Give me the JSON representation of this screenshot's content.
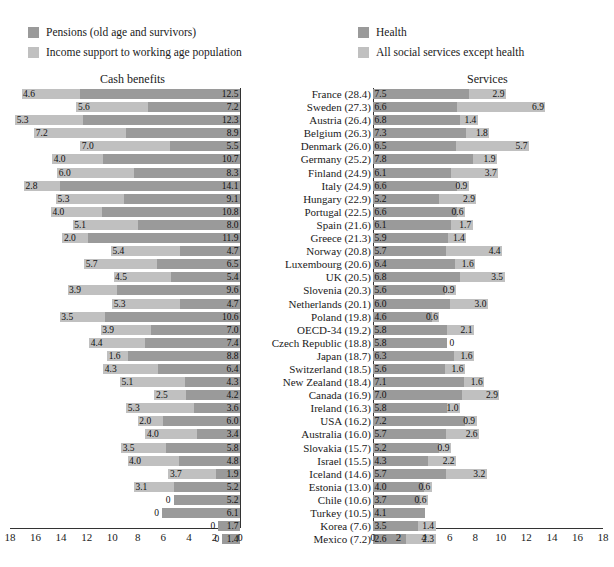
{
  "legends": {
    "left": [
      {
        "swatch": "dark",
        "label": "Pensions (old age and survivors)"
      },
      {
        "swatch": "light",
        "label": "Income support to working age population"
      }
    ],
    "right": [
      {
        "swatch": "dark",
        "label": "Health"
      },
      {
        "swatch": "light",
        "label": "All social services except health"
      }
    ]
  },
  "panels": {
    "left_title": "Cash benefits",
    "right_title": "Services"
  },
  "colors": {
    "dark": "#9a9a9a",
    "light": "#c0c0c0",
    "axis": "#333333",
    "background": "#ffffff"
  },
  "axis": {
    "left_ticks": [
      "18",
      "16",
      "14",
      "12",
      "10",
      "8",
      "6",
      "4",
      "2",
      "0"
    ],
    "right_ticks": [
      "0",
      "2",
      "4",
      "6",
      "8",
      "10",
      "12",
      "14",
      "16",
      "18"
    ],
    "min": 0,
    "max": 18,
    "step": 2
  },
  "chart_data": {
    "type": "bar",
    "orientation": "horizontal",
    "stacked": true,
    "panels": [
      {
        "name": "Cash benefits",
        "direction": "right-to-left",
        "xlim": [
          0,
          18
        ],
        "series": [
          {
            "name": "Pensions (old age and survivors)",
            "color": "#9a9a9a"
          },
          {
            "name": "Income support to working age population",
            "color": "#c0c0c0"
          }
        ]
      },
      {
        "name": "Services",
        "direction": "left-to-right",
        "xlim": [
          0,
          18
        ],
        "series": [
          {
            "name": "Health",
            "color": "#9a9a9a"
          },
          {
            "name": "All social services except health",
            "color": "#c0c0c0"
          }
        ]
      }
    ],
    "categories": [
      "France (28.4)",
      "Sweden (27.3)",
      "Austria (26.4)",
      "Belgium (26.3)",
      "Denmark (26.0)",
      "Germany (25.2)",
      "Finland (24.9)",
      "Italy (24.9)",
      "Hungary (22.9)",
      "Portugal (22.5)",
      "Spain (21.6)",
      "Greece (21.3)",
      "Norway (20.8)",
      "Luxembourg (20.6)",
      "UK (20.5)",
      "Slovenia (20.3)",
      "Netherlands (20.1)",
      "Poland (19.8)",
      "OECD-34 (19.2)",
      "Czech Republic (18.8)",
      "Japan (18.7)",
      "Switzerland (18.5)",
      "New Zealand (18.4)",
      "Canada (16.9)",
      "Ireland (16.3)",
      "USA (16.2)",
      "Australia (16.0)",
      "Slovakia (15.7)",
      "Israel (15.5)",
      "Iceland (14.6)",
      "Estonia (13.0)",
      "Chile (10.6)",
      "Turkey (10.5)",
      "Korea (7.6)",
      "Mexico (7.2)"
    ],
    "rows": [
      {
        "country": "France (28.4)",
        "pensions": 12.5,
        "income_support": 4.6,
        "health": 7.5,
        "other_services": 2.9
      },
      {
        "country": "Sweden (27.3)",
        "pensions": 7.2,
        "income_support": 5.6,
        "health": 6.6,
        "other_services": 6.9
      },
      {
        "country": "Austria (26.4)",
        "pensions": 12.3,
        "income_support": 5.3,
        "health": 6.8,
        "other_services": 1.4
      },
      {
        "country": "Belgium (26.3)",
        "pensions": 8.9,
        "income_support": 7.2,
        "health": 7.3,
        "other_services": 1.8
      },
      {
        "country": "Denmark (26.0)",
        "pensions": 5.5,
        "income_support": 7.0,
        "health": 6.5,
        "other_services": 5.7
      },
      {
        "country": "Germany (25.2)",
        "pensions": 10.7,
        "income_support": 4.0,
        "health": 7.8,
        "other_services": 1.9
      },
      {
        "country": "Finland (24.9)",
        "pensions": 8.3,
        "income_support": 6.0,
        "health": 6.1,
        "other_services": 3.7
      },
      {
        "country": "Italy (24.9)",
        "pensions": 14.1,
        "income_support": 2.8,
        "health": 6.6,
        "other_services": 0.9
      },
      {
        "country": "Hungary (22.9)",
        "pensions": 9.1,
        "income_support": 5.3,
        "health": 5.2,
        "other_services": 2.9
      },
      {
        "country": "Portugal (22.5)",
        "pensions": 10.8,
        "income_support": 4.0,
        "health": 6.6,
        "other_services": 0.6
      },
      {
        "country": "Spain (21.6)",
        "pensions": 8.0,
        "income_support": 5.1,
        "health": 6.1,
        "other_services": 1.7
      },
      {
        "country": "Greece (21.3)",
        "pensions": 11.9,
        "income_support": 2.0,
        "health": 5.9,
        "other_services": 1.4
      },
      {
        "country": "Norway (20.8)",
        "pensions": 4.7,
        "income_support": 5.4,
        "health": 5.7,
        "other_services": 4.4
      },
      {
        "country": "Luxembourg (20.6)",
        "pensions": 6.5,
        "income_support": 5.7,
        "health": 6.4,
        "other_services": 1.6
      },
      {
        "country": "UK (20.5)",
        "pensions": 5.4,
        "income_support": 4.5,
        "health": 6.8,
        "other_services": 3.5
      },
      {
        "country": "Slovenia (20.3)",
        "pensions": 9.6,
        "income_support": 3.9,
        "health": 5.6,
        "other_services": 0.9
      },
      {
        "country": "Netherlands (20.1)",
        "pensions": 4.7,
        "income_support": 5.3,
        "health": 6.0,
        "other_services": 3.0
      },
      {
        "country": "Poland (19.8)",
        "pensions": 10.6,
        "income_support": 3.5,
        "health": 4.6,
        "other_services": 0.6
      },
      {
        "country": "OECD-34 (19.2)",
        "pensions": 7.0,
        "income_support": 3.9,
        "health": 5.8,
        "other_services": 2.1
      },
      {
        "country": "Czech Republic (18.8)",
        "pensions": 7.4,
        "income_support": 4.4,
        "health": 5.8,
        "other_services": 0
      },
      {
        "country": "Japan (18.7)",
        "pensions": 8.8,
        "income_support": 1.6,
        "health": 6.3,
        "other_services": 1.6
      },
      {
        "country": "Switzerland (18.5)",
        "pensions": 6.4,
        "income_support": 4.3,
        "health": 5.6,
        "other_services": 1.6
      },
      {
        "country": "New Zealand (18.4)",
        "pensions": 4.3,
        "income_support": 5.1,
        "health": 7.1,
        "other_services": 1.6
      },
      {
        "country": "Canada (16.9)",
        "pensions": 4.2,
        "income_support": 2.5,
        "health": 7.0,
        "other_services": 2.9
      },
      {
        "country": "Ireland (16.3)",
        "pensions": 3.6,
        "income_support": 5.3,
        "health": 5.8,
        "other_services": 1.0
      },
      {
        "country": "USA (16.2)",
        "pensions": 6.0,
        "income_support": 2.0,
        "health": 7.2,
        "other_services": 0.9
      },
      {
        "country": "Australia (16.0)",
        "pensions": 3.4,
        "income_support": 4.0,
        "health": 5.7,
        "other_services": 2.6
      },
      {
        "country": "Slovakia (15.7)",
        "pensions": 5.8,
        "income_support": 3.5,
        "health": 5.2,
        "other_services": 0.9
      },
      {
        "country": "Israel (15.5)",
        "pensions": 4.8,
        "income_support": 4.0,
        "health": 4.3,
        "other_services": 2.2
      },
      {
        "country": "Iceland (14.6)",
        "pensions": 1.9,
        "income_support": 3.7,
        "health": 5.7,
        "other_services": 3.2
      },
      {
        "country": "Estonia (13.0)",
        "pensions": 5.2,
        "income_support": 3.1,
        "health": 4.0,
        "other_services": 0.6
      },
      {
        "country": "Chile (10.6)",
        "pensions": 5.2,
        "income_support": 0,
        "health": 3.7,
        "other_services": 0.6
      },
      {
        "country": "Turkey (10.5)",
        "pensions": 6.1,
        "income_support": 0,
        "health": 4.1,
        "other_services": 0
      },
      {
        "country": "Korea (7.6)",
        "pensions": 1.7,
        "income_support": 0,
        "health": 3.5,
        "other_services": 1.4
      },
      {
        "country": "Mexico (7.2)",
        "pensions": 1.4,
        "income_support": 0,
        "health": 2.6,
        "other_services": 2.3
      }
    ]
  }
}
